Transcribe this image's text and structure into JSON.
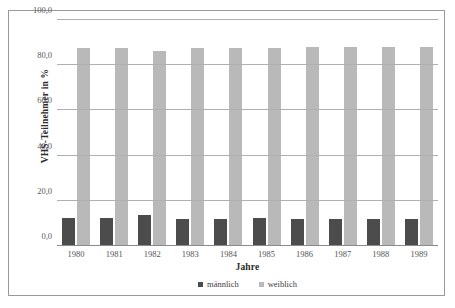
{
  "chart_data": {
    "type": "bar",
    "title": "",
    "xlabel": "Jahre",
    "ylabel": "VHS-Teilnehmer in %",
    "categories": [
      "1980",
      "1981",
      "1982",
      "1983",
      "1984",
      "1985",
      "1986",
      "1987",
      "1988",
      "1989"
    ],
    "series": [
      {
        "name": "männlich",
        "color": "#4c4c4c",
        "values": [
          12.2,
          12.2,
          13.8,
          12.0,
          12.0,
          12.3,
          12.0,
          11.8,
          11.8,
          11.8
        ]
      },
      {
        "name": "weiblich",
        "color": "#b9b9b9",
        "values": [
          87.6,
          87.6,
          86.1,
          87.8,
          87.8,
          87.6,
          88.0,
          88.1,
          88.1,
          88.2
        ]
      }
    ],
    "ylim": [
      0,
      100
    ],
    "yticks": [
      "0,0",
      "20,0",
      "40,0",
      "60,0",
      "80,0",
      "100,0"
    ],
    "ytick_values": [
      0,
      20,
      40,
      60,
      80,
      100
    ],
    "grid": true,
    "legend_position": "bottom"
  }
}
